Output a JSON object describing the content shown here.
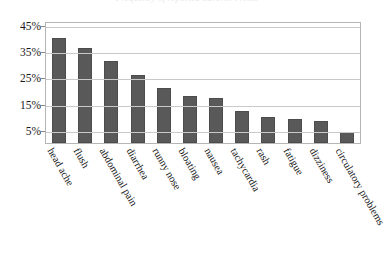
{
  "title": {
    "text": "Frequency of reported adverse events",
    "visible": "partially-clipped"
  },
  "axes": {
    "y_ticks": [
      "45%",
      "35%",
      "25%",
      "15%",
      "5%"
    ],
    "y_label": "",
    "x_label": ""
  },
  "colors": {
    "bar_fill": "#595959",
    "bar_border": "#4c4c4c",
    "gridline": "#c9c9c9",
    "frame": "#b5b5b5",
    "text": "#141414",
    "background": "#ffffff"
  },
  "chart_data": {
    "type": "bar",
    "title": "Frequency of reported adverse events",
    "xlabel": "",
    "ylabel": "",
    "ylim": [
      0,
      48
    ],
    "grid": true,
    "legend": "none",
    "orientation": "vertical",
    "tick_labels": [
      "5%",
      "15%",
      "25%",
      "35%",
      "45%"
    ],
    "categories": [
      "head ache",
      "flush",
      "abdominal pain",
      "diarrhea",
      "runny nose",
      "bloating",
      "nausea",
      "tachycardia",
      "rash",
      "fatigue",
      "dizziness",
      "circulatory problems"
    ],
    "values": [
      40,
      36,
      31,
      26,
      21,
      18,
      17,
      12,
      10,
      9,
      8.5,
      4
    ],
    "units": "percent"
  }
}
